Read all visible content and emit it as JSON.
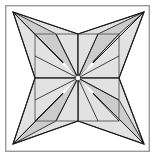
{
  "figure": {
    "canvas": {
      "width": 157,
      "height": 160
    },
    "colors": {
      "background": "#ffffff",
      "frame_stroke": "#9a9a9a",
      "facet_fill_light": "#e2e2e2",
      "facet_fill_mid": "#cccccc",
      "facet_fill_pale": "#f2f2f2",
      "outline_stroke": "#1a1a1a",
      "inner_square_stroke": "#6e6e6e"
    },
    "frame": {
      "x": 5,
      "y": 5,
      "width": 145,
      "height": 147,
      "stroke_width": 1.4
    },
    "center": {
      "x": 78,
      "y": 78
    },
    "inner_square": {
      "left": 35,
      "top": 34,
      "right": 119,
      "bottom": 121
    },
    "star_tips": [
      {
        "name": "tip-top-left",
        "x": 13,
        "y": 12
      },
      {
        "name": "tip-top-right",
        "x": 144,
        "y": 12
      },
      {
        "name": "tip-bottom-right",
        "x": 144,
        "y": 144
      },
      {
        "name": "tip-bottom-left",
        "x": 13,
        "y": 144
      }
    ],
    "notches": [
      {
        "name": "notch-top",
        "x": 78,
        "y": 34
      },
      {
        "name": "notch-right",
        "x": 119,
        "y": 78
      },
      {
        "name": "notch-bottom",
        "x": 78,
        "y": 121
      },
      {
        "name": "notch-left",
        "x": 35,
        "y": 78
      }
    ],
    "facet_groups": [
      {
        "name": "facet-group-top-left",
        "tip": {
          "x": 13,
          "y": 12
        },
        "fan_targets": [
          {
            "x": 78,
            "y": 34
          },
          {
            "x": 56,
            "y": 34
          },
          {
            "x": 35,
            "y": 34
          },
          {
            "x": 35,
            "y": 56
          },
          {
            "x": 35,
            "y": 78
          }
        ]
      },
      {
        "name": "facet-group-top-right",
        "tip": {
          "x": 144,
          "y": 12
        },
        "fan_targets": [
          {
            "x": 78,
            "y": 34
          },
          {
            "x": 98,
            "y": 34
          },
          {
            "x": 119,
            "y": 34
          },
          {
            "x": 119,
            "y": 56
          },
          {
            "x": 119,
            "y": 78
          }
        ]
      },
      {
        "name": "facet-group-bottom-right",
        "tip": {
          "x": 144,
          "y": 144
        },
        "fan_targets": [
          {
            "x": 119,
            "y": 78
          },
          {
            "x": 119,
            "y": 100
          },
          {
            "x": 119,
            "y": 121
          },
          {
            "x": 98,
            "y": 121
          },
          {
            "x": 78,
            "y": 121
          }
        ]
      },
      {
        "name": "facet-group-bottom-left",
        "tip": {
          "x": 13,
          "y": 144
        },
        "fan_targets": [
          {
            "x": 78,
            "y": 121
          },
          {
            "x": 56,
            "y": 121
          },
          {
            "x": 35,
            "y": 121
          },
          {
            "x": 35,
            "y": 100
          },
          {
            "x": 35,
            "y": 78
          }
        ]
      }
    ],
    "radial_spokes": [
      {
        "name": "spoke-to-tip-top-left",
        "x2": 13,
        "y2": 12
      },
      {
        "name": "spoke-to-tip-top-right",
        "x2": 144,
        "y2": 12
      },
      {
        "name": "spoke-to-tip-bottom-right",
        "x2": 144,
        "y2": 144
      },
      {
        "name": "spoke-to-tip-bottom-left",
        "x2": 13,
        "y2": 144
      },
      {
        "name": "spoke-to-corner-tl",
        "x2": 35,
        "y2": 34
      },
      {
        "name": "spoke-to-corner-tr",
        "x2": 119,
        "y2": 34
      },
      {
        "name": "spoke-to-corner-br",
        "x2": 119,
        "y2": 121
      },
      {
        "name": "spoke-to-corner-bl",
        "x2": 35,
        "y2": 121
      },
      {
        "name": "spoke-to-edge-top-a",
        "x2": 56,
        "y2": 34
      },
      {
        "name": "spoke-to-edge-top-b",
        "x2": 98,
        "y2": 34
      },
      {
        "name": "spoke-to-edge-right-a",
        "x2": 119,
        "y2": 56
      },
      {
        "name": "spoke-to-edge-right-b",
        "x2": 119,
        "y2": 100
      },
      {
        "name": "spoke-to-edge-bottom-a",
        "x2": 98,
        "y2": 121
      },
      {
        "name": "spoke-to-edge-bottom-b",
        "x2": 56,
        "y2": 121
      },
      {
        "name": "spoke-to-edge-left-a",
        "x2": 35,
        "y2": 100
      },
      {
        "name": "spoke-to-edge-left-b",
        "x2": 35,
        "y2": 56
      }
    ],
    "star_outline_path": "M 13 12 L 78 34 L 144 12 L 119 78 L 144 144 L 78 121 L 13 144 L 35 78 Z"
  }
}
